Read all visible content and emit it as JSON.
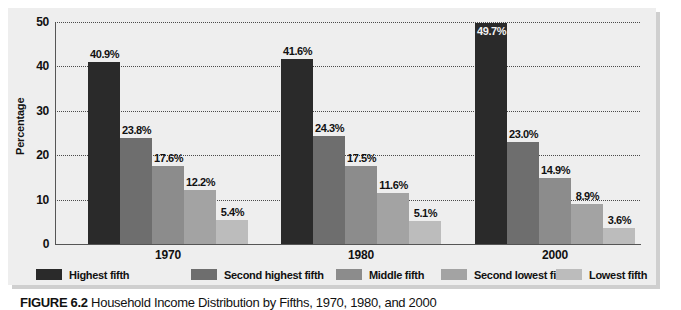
{
  "figure": {
    "caption_label": "FIGURE 6.2",
    "caption_text": "Household Income Distribution by Fifths, 1970, 1980, and 2000"
  },
  "axes": {
    "ylabel": "Percentage",
    "yticks": [
      "0",
      "10",
      "20",
      "30",
      "40",
      "50"
    ]
  },
  "colors": {
    "panel_background": "#eeeeee",
    "highest_fifth": "#2a2a2a",
    "second_highest_fifth": "#6e6e6e",
    "middle_fifth": "#8c8c8c",
    "second_lowest_fifth": "#a3a3a3",
    "lowest_fifth": "#bcbcbc",
    "gridline": "#4a4a4a",
    "axis": "#555555"
  },
  "legend": {
    "items": [
      {
        "label": "Highest fifth",
        "color": "#2a2a2a"
      },
      {
        "label": "Second highest fifth",
        "color": "#6e6e6e"
      },
      {
        "label": "Middle fifth",
        "color": "#8c8c8c"
      },
      {
        "label": "Second lowest fifth",
        "color": "#a3a3a3"
      },
      {
        "label": "Lowest fifth",
        "color": "#bcbcbc"
      }
    ]
  },
  "chart_data": {
    "type": "bar",
    "title": "Household Income Distribution by Fifths, 1970, 1980, and 2000",
    "xlabel": "",
    "ylabel": "Percentage",
    "ylim": [
      0,
      50
    ],
    "yticks": [
      0,
      10,
      20,
      30,
      40,
      50
    ],
    "grid": true,
    "legend_position": "bottom",
    "categories": [
      "1970",
      "1980",
      "2000"
    ],
    "series": [
      {
        "name": "Highest fifth",
        "color": "#2a2a2a",
        "values": [
          40.9,
          41.6,
          49.7
        ],
        "labels": [
          "40.9%",
          "41.6%",
          "49.7%"
        ]
      },
      {
        "name": "Second highest fifth",
        "color": "#6e6e6e",
        "values": [
          23.8,
          24.3,
          23.0
        ],
        "labels": [
          "23.8%",
          "24.3%",
          "23.0%"
        ]
      },
      {
        "name": "Middle fifth",
        "color": "#8c8c8c",
        "values": [
          17.6,
          17.5,
          14.9
        ],
        "labels": [
          "17.6%",
          "17.5%",
          "14.9%"
        ]
      },
      {
        "name": "Second lowest fifth",
        "color": "#a3a3a3",
        "values": [
          12.2,
          11.6,
          8.9
        ],
        "labels": [
          "12.2%",
          "11.6%",
          "8.9%"
        ]
      },
      {
        "name": "Lowest fifth",
        "color": "#bcbcbc",
        "values": [
          5.4,
          5.1,
          3.6
        ],
        "labels": [
          "5.4%",
          "5.1%",
          "3.6%"
        ]
      }
    ]
  }
}
